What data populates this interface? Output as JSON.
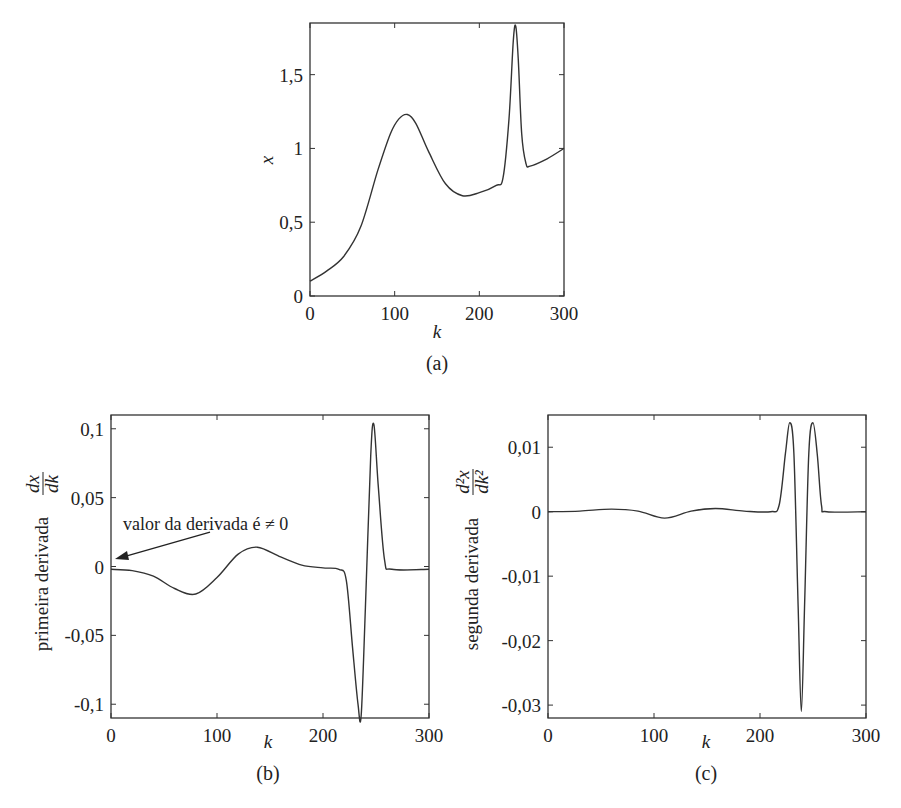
{
  "figure": {
    "panels": [
      {
        "id": "a",
        "label": "(a)"
      },
      {
        "id": "b",
        "label": "(b)"
      },
      {
        "id": "c",
        "label": "(c)"
      }
    ]
  },
  "chart_data": [
    {
      "type": "line",
      "panel_label": "(a)",
      "title": "",
      "xlabel": "k",
      "ylabel": "x",
      "xlim": [
        0,
        300
      ],
      "ylim": [
        0,
        1.85
      ],
      "xticks": [
        0,
        100,
        200,
        300
      ],
      "xtick_labels": [
        "0",
        "100",
        "200",
        "300"
      ],
      "yticks": [
        0,
        0.5,
        1,
        1.5
      ],
      "ytick_labels": [
        "0",
        "0,5",
        "1",
        "1,5"
      ],
      "grid": false,
      "series": [
        {
          "name": "x(k)",
          "x": [
            0,
            20,
            40,
            60,
            80,
            95,
            105,
            115,
            125,
            140,
            160,
            180,
            200,
            220,
            228,
            235,
            240,
            243,
            246,
            250,
            255,
            260,
            280,
            300
          ],
          "y": [
            0.1,
            0.17,
            0.27,
            0.47,
            0.85,
            1.1,
            1.2,
            1.23,
            1.17,
            0.98,
            0.76,
            0.68,
            0.7,
            0.75,
            0.8,
            1.2,
            1.72,
            1.83,
            1.6,
            1.1,
            0.9,
            0.88,
            0.93,
            1.0
          ]
        }
      ]
    },
    {
      "type": "line",
      "panel_label": "(b)",
      "title": "",
      "xlabel": "k",
      "ylabel": "primeira derivada dx/dk",
      "ylabel_text": "primeira derivada",
      "ylabel_frac_num": "dx",
      "ylabel_frac_den": "dk",
      "xlim": [
        0,
        300
      ],
      "ylim": [
        -0.11,
        0.11
      ],
      "xticks": [
        0,
        100,
        200,
        300
      ],
      "xtick_labels": [
        "0",
        "100",
        "200",
        "300"
      ],
      "yticks": [
        -0.1,
        -0.05,
        0,
        0.05,
        0.1
      ],
      "ytick_labels": [
        "-0,1",
        "-0,05",
        "0",
        "0,05",
        "0,1"
      ],
      "grid": false,
      "annotations": [
        {
          "text": "valor da derivada é ≠ 0",
          "arrow_to": [
            0,
            -0.002
          ]
        }
      ],
      "series": [
        {
          "name": "dx/dk",
          "x": [
            0,
            20,
            40,
            60,
            80,
            100,
            120,
            138,
            160,
            180,
            200,
            215,
            222,
            228,
            233,
            236,
            240,
            245,
            248,
            252,
            258,
            265,
            300
          ],
          "y": [
            -0.002,
            -0.003,
            -0.007,
            -0.016,
            -0.02,
            -0.008,
            0.009,
            0.014,
            0.007,
            0.001,
            -0.001,
            -0.002,
            -0.01,
            -0.06,
            -0.1,
            -0.108,
            -0.03,
            0.08,
            0.103,
            0.06,
            0.005,
            -0.002,
            -0.002
          ]
        }
      ]
    },
    {
      "type": "line",
      "panel_label": "(c)",
      "title": "",
      "xlabel": "k",
      "ylabel": "segunda derivada d²x/dk²",
      "ylabel_text": "segunda derivada",
      "ylabel_frac_num": "d²x",
      "ylabel_frac_den": "dk²",
      "xlim": [
        0,
        300
      ],
      "ylim": [
        -0.032,
        0.015
      ],
      "xticks": [
        0,
        100,
        200,
        300
      ],
      "xtick_labels": [
        "0",
        "100",
        "200",
        "300"
      ],
      "yticks": [
        -0.03,
        -0.02,
        -0.01,
        0,
        0.01
      ],
      "ytick_labels": [
        "-0,03",
        "-0,02",
        "-0,01",
        "0",
        "0,01"
      ],
      "grid": false,
      "series": [
        {
          "name": "d²x/dk²",
          "x": [
            0,
            30,
            60,
            85,
            110,
            135,
            158,
            185,
            210,
            218,
            224,
            228,
            232,
            236,
            239,
            242,
            246,
            250,
            254,
            258,
            263,
            300
          ],
          "y": [
            0,
            0.0001,
            0.0004,
            0.0001,
            -0.001,
            0.0001,
            0.0005,
            0.0001,
            0,
            0.001,
            0.009,
            0.0138,
            0.009,
            -0.015,
            -0.031,
            -0.015,
            0.009,
            0.0138,
            0.009,
            0.001,
            0,
            0
          ]
        }
      ]
    }
  ]
}
